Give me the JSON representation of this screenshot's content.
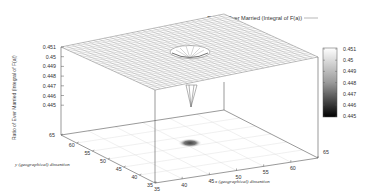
{
  "chart_data": {
    "type": "surface3d",
    "title": "",
    "legend": [
      {
        "label": "Ratio of Ever Married (Integral of F(a))",
        "style": "line"
      }
    ],
    "xlabel": "x (geographical) dimention",
    "ylabel": "y (geographical) dimention",
    "zlabel": "Ratio of Ever Married (Integral of F(a))",
    "xticks": [
      "35",
      "40",
      "45",
      "50",
      "55",
      "60",
      "65"
    ],
    "yticks": [
      "35",
      "40",
      "45",
      "50",
      "55",
      "60",
      "65"
    ],
    "zticks": [
      "0.451",
      "0.45",
      "0.449",
      "0.448",
      "0.447",
      "0.446",
      "0.445"
    ],
    "xlim": [
      35,
      65
    ],
    "ylim": [
      35,
      65
    ],
    "zlim": [
      0.445,
      0.451
    ],
    "colorbar": {
      "ticks": [
        "0.451",
        "0.45",
        "0.449",
        "0.448",
        "0.447",
        "0.446",
        "0.445"
      ],
      "range": [
        0.445,
        0.451
      ],
      "colormap": "gray (black=low, white=high)"
    },
    "surface": {
      "baseline_value": 0.451,
      "dip_center": {
        "x": 50,
        "y": 50
      },
      "dip_min_value": 0.445,
      "description": "Flat plane at ~0.451 with a narrow downward spike near the center (x≈50, y≈50) reaching ~0.445"
    },
    "floor_heatmap": {
      "dark_spot_center": {
        "x": 50,
        "y": 50
      },
      "description": "Mostly white floor projection with a small dark gray blob at the dip location"
    },
    "grid": true
  }
}
